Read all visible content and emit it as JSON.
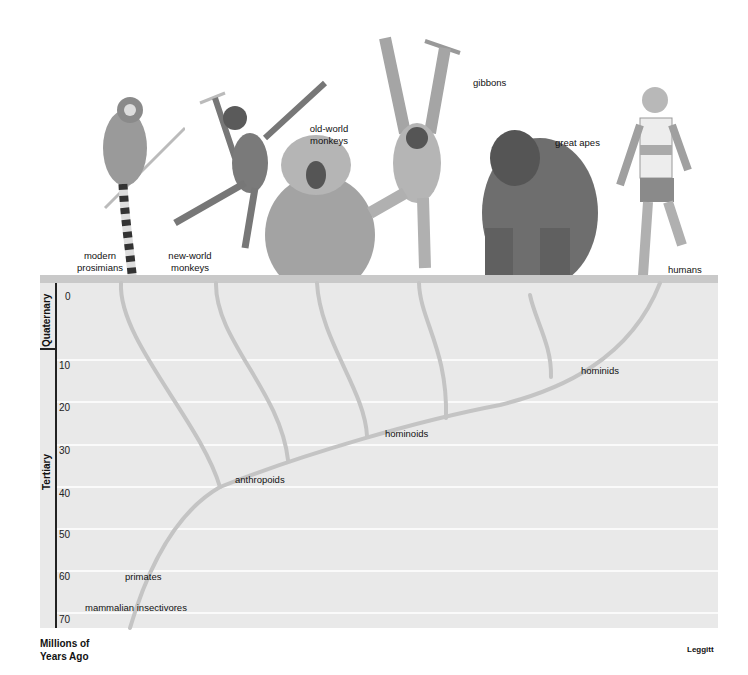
{
  "diagram": {
    "axis": {
      "title_line1": "Millions of",
      "title_line2": "Years Ago",
      "ticks": [
        "0",
        "10",
        "20",
        "30",
        "40",
        "50",
        "60",
        "70"
      ]
    },
    "eras": {
      "quaternary": "Quaternary",
      "tertiary": "Tertiary"
    },
    "groups": {
      "prosimians": "modern prosimians",
      "prosimians_l1": "modern",
      "prosimians_l2": "prosimians",
      "new_world_l1": "new-world",
      "new_world_l2": "monkeys",
      "old_world_l1": "old-world",
      "old_world_l2": "monkeys",
      "gibbons": "gibbons",
      "great_apes": "great apes",
      "humans": "humans"
    },
    "nodes": {
      "hominids": "hominids",
      "hominoids": "hominoids",
      "anthropoids": "anthropoids",
      "primates": "primates",
      "insectivores": "mammalian insectivores"
    },
    "credit": "Leggitt",
    "colors": {
      "panel": "#e9e9e9",
      "topbar": "#c9c9c9",
      "branch": "#c4c4c4",
      "gridline": "#fafafa",
      "axis": "#222222"
    }
  }
}
